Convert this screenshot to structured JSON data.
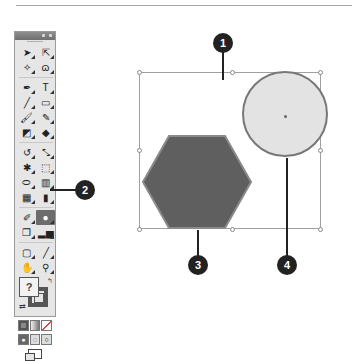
{
  "tools_panel": {
    "title_controls": [
      "collapse",
      "close"
    ],
    "tools": [
      {
        "name": "selection-tool",
        "glyph": "➤"
      },
      {
        "name": "direct-selection-tool",
        "glyph": "⇱"
      },
      {
        "name": "magic-wand-tool",
        "glyph": "✧"
      },
      {
        "name": "lasso-tool",
        "glyph": "ɷ"
      },
      {
        "name": "pen-tool",
        "glyph": "✒"
      },
      {
        "name": "type-tool",
        "glyph": "T"
      },
      {
        "name": "line-segment-tool",
        "glyph": "╱"
      },
      {
        "name": "rectangle-tool",
        "glyph": "▭"
      },
      {
        "name": "paintbrush-tool",
        "glyph": "🖌"
      },
      {
        "name": "pencil-tool",
        "glyph": "✎"
      },
      {
        "name": "blob-brush-tool",
        "glyph": "◩"
      },
      {
        "name": "eraser-tool",
        "glyph": "◆"
      },
      {
        "name": "rotate-tool",
        "glyph": "↺"
      },
      {
        "name": "scale-tool",
        "glyph": "⤡"
      },
      {
        "name": "puppet-warp-tool",
        "glyph": "✱"
      },
      {
        "name": "free-transform-tool",
        "glyph": "⬚"
      },
      {
        "name": "shape-builder-tool",
        "glyph": "⬭"
      },
      {
        "name": "perspective-grid-tool",
        "glyph": "▥"
      },
      {
        "name": "mesh-tool",
        "glyph": "▦"
      },
      {
        "name": "gradient-tool",
        "glyph": "▮"
      },
      {
        "name": "eyedropper-tool",
        "glyph": "✐"
      },
      {
        "name": "live-paint-bucket-tool",
        "glyph": "●"
      },
      {
        "name": "symbol-sprayer-tool",
        "glyph": "❐"
      },
      {
        "name": "column-graph-tool",
        "glyph": "▂▅"
      },
      {
        "name": "artboard-tool",
        "glyph": "▢"
      },
      {
        "name": "slice-tool",
        "glyph": "╱"
      },
      {
        "name": "hand-tool",
        "glyph": "✋"
      },
      {
        "name": "zoom-tool",
        "glyph": "⚲"
      }
    ],
    "active_tool_index": 21,
    "fill_box_label": "?",
    "swap_glyph": "⇄",
    "default_glyph": "↰",
    "draw_modes": [
      "normal",
      "behind",
      "inside"
    ],
    "screen_mode": "screen-mode"
  },
  "canvas": {
    "shapes": [
      {
        "type": "hexagon",
        "fill": "#5f5f5f",
        "stroke": "#8a8a8a"
      },
      {
        "type": "circle",
        "fill": "#e3e3e3",
        "stroke": "#777777"
      }
    ]
  },
  "callouts": [
    {
      "number": "1",
      "target": "selection-bounding-box"
    },
    {
      "number": "2",
      "target": "live-paint-bucket-tool"
    },
    {
      "number": "3",
      "target": "hexagon"
    },
    {
      "number": "4",
      "target": "circle"
    }
  ]
}
